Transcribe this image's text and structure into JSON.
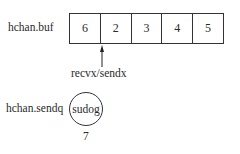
{
  "buffer": {
    "label": "hchan.buf",
    "cells": [
      "6",
      "2",
      "3",
      "4",
      "5"
    ]
  },
  "pointer": {
    "label": "recvx/sendx",
    "points_to_cell_boundary": "between 6 and 2"
  },
  "sendq": {
    "label": "hchan.sendq",
    "node_label": "sudog",
    "value": "7"
  }
}
